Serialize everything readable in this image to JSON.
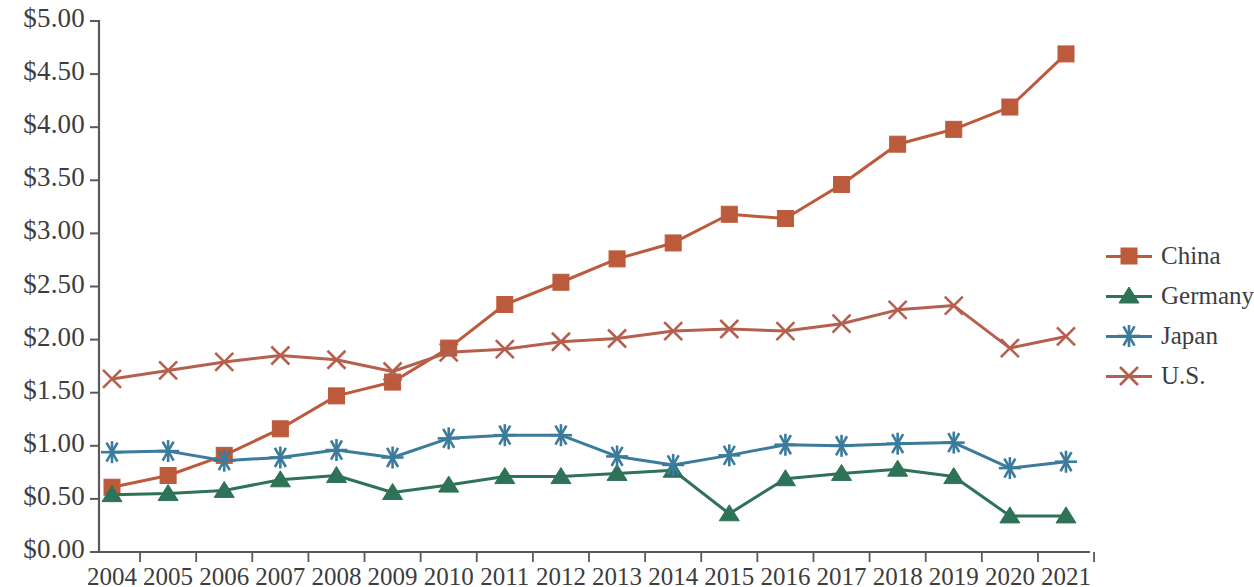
{
  "chart_data": {
    "type": "line",
    "title": "",
    "subtitle": "",
    "xlabel": "",
    "ylabel": "",
    "grid": false,
    "legend_position": "right",
    "ylim": [
      0,
      5
    ],
    "ytick_labels": [
      "$0.00",
      "$0.50",
      "$1.00",
      "$1.50",
      "$2.00",
      "$2.50",
      "$3.00",
      "$3.50",
      "$4.00",
      "$4.50",
      "$5.00"
    ],
    "ytick_values": [
      0,
      0.5,
      1,
      1.5,
      2,
      2.5,
      3,
      3.5,
      4,
      4.5,
      5
    ],
    "categories": [
      "2004",
      "2005",
      "2006",
      "2007",
      "2008",
      "2009",
      "2010",
      "2011",
      "2012",
      "2013",
      "2014",
      "2015",
      "2016",
      "2017",
      "2018",
      "2019",
      "2020",
      "2021"
    ],
    "x": [
      2004,
      2005,
      2006,
      2007,
      2008,
      2009,
      2010,
      2011,
      2012,
      2013,
      2014,
      2015,
      2016,
      2017,
      2018,
      2019,
      2020,
      2021
    ],
    "series": [
      {
        "name": "China",
        "color": "#bc5a3c",
        "marker": "square",
        "values": [
          0.61,
          0.72,
          0.91,
          1.16,
          1.47,
          1.6,
          1.92,
          2.33,
          2.54,
          2.76,
          2.91,
          3.18,
          3.14,
          3.46,
          3.84,
          3.98,
          4.19,
          4.69
        ]
      },
      {
        "name": "Germany",
        "color": "#2e7257",
        "marker": "triangle",
        "values": [
          0.54,
          0.55,
          0.58,
          0.68,
          0.72,
          0.56,
          0.63,
          0.71,
          0.71,
          0.74,
          0.77,
          0.36,
          0.69,
          0.74,
          0.78,
          0.71,
          0.34,
          0.34
        ]
      },
      {
        "name": "Japan",
        "color": "#3b7b9c",
        "marker": "asterisk",
        "values": [
          0.94,
          0.95,
          0.86,
          0.89,
          0.96,
          0.89,
          1.07,
          1.1,
          1.1,
          0.9,
          0.82,
          0.91,
          1.01,
          1.0,
          1.02,
          1.03,
          0.79,
          0.85
        ]
      },
      {
        "name": "U.S.",
        "color": "#b5604f",
        "marker": "x",
        "values": [
          1.63,
          1.71,
          1.79,
          1.85,
          1.81,
          1.7,
          1.88,
          1.91,
          1.98,
          2.01,
          2.08,
          2.1,
          2.08,
          2.15,
          2.28,
          2.32,
          1.92,
          2.03
        ]
      }
    ]
  },
  "legend": {
    "items": [
      {
        "label": "China"
      },
      {
        "label": "Germany"
      },
      {
        "label": "Japan"
      },
      {
        "label": "U.S."
      }
    ]
  },
  "axes": {
    "axis_color": "#5a5a5a"
  }
}
